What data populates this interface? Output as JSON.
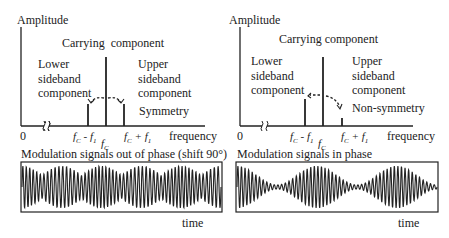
{
  "left": {
    "y_axis_label": "Amplitude",
    "carrier_label": "Carrying  component",
    "lower_label": [
      "Lower",
      "sideband",
      "component"
    ],
    "upper_label": [
      "Upper",
      "sideband",
      "component"
    ],
    "symmetry_label": "Symmetry",
    "origin": "0",
    "tick_lower": "fC - f1",
    "tick_carrier": "fC",
    "tick_upper": "fC + f1",
    "x_axis_label": "frequency",
    "signal_title": "Modulation signals out of phase (shift 90°)",
    "time_label": "time",
    "bars": {
      "lower": 0.22,
      "carrier": 0.7,
      "upper": 0.22
    }
  },
  "right": {
    "y_axis_label": "Amplitude",
    "carrier_label": "Carrying component",
    "lower_label": [
      "Lower",
      "sideband",
      "component"
    ],
    "upper_label": [
      "Upper",
      "sideband",
      "component"
    ],
    "symmetry_label": "Non-symmetry",
    "origin": "0",
    "tick_lower": "fC - f1",
    "tick_carrier": "fC",
    "tick_upper": "fC + f1",
    "x_axis_label": "frequency",
    "signal_title": "Modulation signals in phase",
    "time_label": "time",
    "bars": {
      "lower": 0.28,
      "carrier": 0.7,
      "upper": 0.05
    }
  }
}
